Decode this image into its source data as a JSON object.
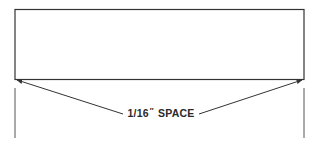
{
  "diagram": {
    "label": {
      "fraction": "1/16",
      "inch_mark": "″",
      "word": "SPACE"
    },
    "stroke_color": "#333333"
  }
}
